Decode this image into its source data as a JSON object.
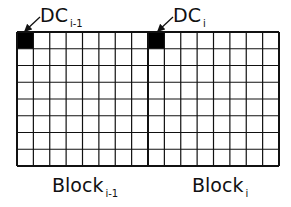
{
  "diagram": {
    "labels": {
      "dc_prev": {
        "main": "DC",
        "sub": "i-1"
      },
      "dc_curr": {
        "main": "DC",
        "sub": "i"
      },
      "block_prev": {
        "main": "Block",
        "sub": "i-1"
      },
      "block_curr": {
        "main": "Block",
        "sub": "i"
      }
    },
    "grid": {
      "rows": 8,
      "cols_per_block": 8,
      "blocks": 2
    },
    "colors": {
      "line": "#111111",
      "dc_fill": "#000000",
      "background": "#ffffff"
    }
  }
}
